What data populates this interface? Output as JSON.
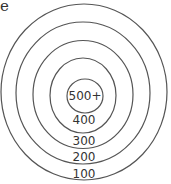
{
  "fragment_text": "e",
  "target": {
    "rings": [
      {
        "label": "500+",
        "cx": 85,
        "cy": 96,
        "rx": 18,
        "ry": 17
      },
      {
        "label": "400",
        "cx": 83,
        "cy": 95,
        "rx": 33,
        "ry": 38
      },
      {
        "label": "300",
        "cx": 83,
        "cy": 94,
        "rx": 50,
        "ry": 54
      },
      {
        "label": "200",
        "cx": 83,
        "cy": 93,
        "rx": 67,
        "ry": 70
      },
      {
        "label": "100",
        "cx": 84,
        "cy": 92,
        "rx": 84,
        "ry": 88
      }
    ],
    "labels": {
      "r500": "500+",
      "r400": "400",
      "r300": "300",
      "r200": "200",
      "r100": "100"
    },
    "stroke_color": "#555555"
  }
}
